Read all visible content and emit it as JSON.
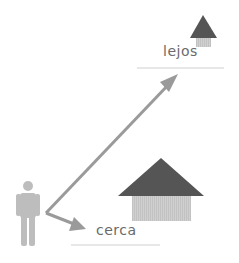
{
  "labels": {
    "far": "lejos",
    "near": "cerca"
  },
  "colors": {
    "arrow": "#9a9a9a",
    "roof": "#555555",
    "wall": "#cccccc",
    "person": "#bdbdbd",
    "line": "#cfcfcf",
    "text": "#6a6a6a"
  },
  "icons": {
    "person": "person-icon",
    "house_near": "house-icon",
    "house_far": "house-icon"
  }
}
